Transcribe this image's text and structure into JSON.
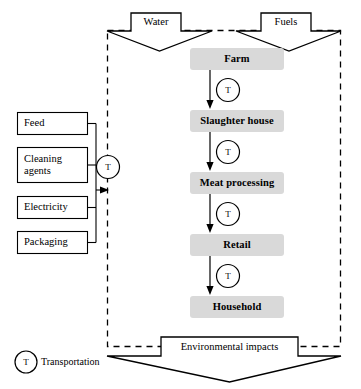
{
  "diagram": {
    "colors": {
      "process_fill": "#d9d9d9",
      "box_stroke": "#000000",
      "input_fill": "#ffffff",
      "boundary_stroke": "#000000",
      "arrow_fill": "#ffffff",
      "text": "#000000"
    },
    "inputs_top": [
      {
        "id": "water",
        "label": "Water"
      },
      {
        "id": "fuels",
        "label": "Fuels"
      }
    ],
    "inputs_left": [
      {
        "id": "feed",
        "label": "Feed"
      },
      {
        "id": "cleaning-agents",
        "label": "Cleaning\nagents"
      },
      {
        "id": "electricity",
        "label": "Electricity"
      },
      {
        "id": "packaging",
        "label": "Packaging"
      }
    ],
    "process_stages": [
      {
        "id": "farm",
        "label": "Farm"
      },
      {
        "id": "slaughter-house",
        "label": "Slaughter house"
      },
      {
        "id": "meat-processing",
        "label": "Meat processing"
      },
      {
        "id": "retail",
        "label": "Retail"
      },
      {
        "id": "household",
        "label": "Household"
      }
    ],
    "transport_nodes": [
      {
        "id": "transport-inputs",
        "label": "T"
      },
      {
        "id": "transport-farm-slaughter",
        "label": "T"
      },
      {
        "id": "transport-slaughter-meat",
        "label": "T"
      },
      {
        "id": "transport-meat-retail",
        "label": "T"
      },
      {
        "id": "transport-retail-household",
        "label": "T"
      }
    ],
    "output": {
      "id": "environmental-impacts",
      "label": "Environmental impacts"
    },
    "legend": {
      "symbol": "T",
      "label": "Transportation"
    }
  }
}
